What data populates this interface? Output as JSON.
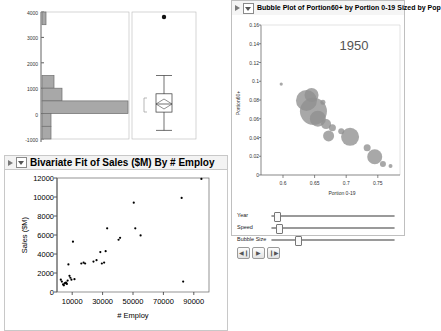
{
  "histogram_panel": {
    "name": "histogram-boxplot"
  },
  "bivariate_panel": {
    "title": "Bivariate Fit of Sales ($M) By # Employ",
    "disclosure_icon": "chevron-down-icon",
    "triangle_icon": "triangle-right-icon"
  },
  "bubble_panel": {
    "title": "Bubble Plot of Portion60+ by Portion 0-19 Sized by Pop",
    "disclosure_icon": "chevron-down-icon",
    "triangle_icon": "triangle-right-icon",
    "year_label": "1950",
    "controls": {
      "sliders": [
        {
          "label": "Year",
          "value_pct": 2
        },
        {
          "label": "Speed",
          "value_pct": 4
        },
        {
          "label": "Bubble Size",
          "value_pct": 19
        }
      ],
      "buttons": [
        {
          "name": "step-back-button",
          "glyph": "◀❙"
        },
        {
          "name": "play-button",
          "glyph": "▶"
        },
        {
          "name": "step-forward-button",
          "glyph": "❙▶"
        }
      ]
    }
  },
  "chart_data": [
    {
      "type": "bar",
      "id": "sales-histogram",
      "orientation": "horizontal",
      "title": "",
      "xlabel": "",
      "ylabel": "",
      "ylim": [
        -1000,
        4000
      ],
      "yticks": [
        -1000,
        0,
        1000,
        2000,
        3000,
        4000
      ],
      "grid": false,
      "bins": [
        {
          "low": 3500,
          "high": 4000,
          "count": 1
        },
        {
          "low": 1000,
          "high": 1500,
          "count": 3
        },
        {
          "low": 500,
          "high": 1000,
          "count": 5
        },
        {
          "low": 0,
          "high": 500,
          "count": 26
        },
        {
          "low": -500,
          "high": 0,
          "count": 2
        },
        {
          "low": -1000,
          "high": -500,
          "count": 2
        }
      ],
      "categories": [
        "-1000 to -500",
        "-500 to 0",
        "0 to 500",
        "500 to 1000",
        "1000 to 1500",
        "3500 to 4000"
      ],
      "values": [
        2,
        2,
        26,
        5,
        3,
        1
      ]
    },
    {
      "type": "boxplot",
      "id": "sales-boxplot",
      "title": "",
      "ylim": [
        -1000,
        4000
      ],
      "min_whisker": -700,
      "q1": 60,
      "median": 380,
      "q3": 780,
      "max_whisker": 1520,
      "outliers": [
        3800
      ],
      "mean_diamond": {
        "low": 180,
        "mid": 380,
        "high": 560
      }
    },
    {
      "type": "scatter",
      "id": "bivariate-fit",
      "title": "Bivariate Fit of Sales ($M) By # Employ",
      "xlabel": "# Employ",
      "ylabel": "Sales ($M)",
      "xlim": [
        0,
        100000
      ],
      "ylim": [
        0,
        12000
      ],
      "xticks": [
        10000,
        30000,
        50000,
        70000,
        90000
      ],
      "xticklabels": [
        "10000",
        "30000",
        "50000",
        "70000",
        "90000"
      ],
      "yticks": [
        0,
        2000,
        4000,
        6000,
        8000,
        10000,
        12000
      ],
      "yticklabels": [
        "0",
        "2000",
        "4000",
        "6000",
        "8000",
        "10000",
        "12000"
      ],
      "grid": false,
      "points": [
        [
          2500,
          1300
        ],
        [
          3200,
          1100
        ],
        [
          4000,
          800
        ],
        [
          4500,
          700
        ],
        [
          5000,
          900
        ],
        [
          5500,
          950
        ],
        [
          6000,
          1000
        ],
        [
          6500,
          850
        ],
        [
          7000,
          1200
        ],
        [
          7500,
          2900
        ],
        [
          8200,
          1700
        ],
        [
          8800,
          1500
        ],
        [
          9500,
          1300
        ],
        [
          10500,
          5300
        ],
        [
          11500,
          1350
        ],
        [
          16000,
          3000
        ],
        [
          17500,
          3100
        ],
        [
          18500,
          3000
        ],
        [
          24000,
          3200
        ],
        [
          26000,
          3350
        ],
        [
          28500,
          4200
        ],
        [
          29500,
          3000
        ],
        [
          31000,
          3100
        ],
        [
          32000,
          4300
        ],
        [
          33000,
          6700
        ],
        [
          40500,
          5500
        ],
        [
          41500,
          5700
        ],
        [
          50500,
          9400
        ],
        [
          51500,
          6700
        ],
        [
          55000,
          5950
        ],
        [
          82000,
          9900
        ],
        [
          83000,
          1100
        ],
        [
          95000,
          11900
        ]
      ]
    },
    {
      "type": "scatter",
      "id": "bubble-plot",
      "title": "Bubble Plot of Portion60+ by Portion 0-19 Sized by Pop",
      "xlabel": "Portion 0-19",
      "ylabel": "Portion60+",
      "xlim": [
        0.565,
        0.785
      ],
      "ylim": [
        0,
        0.165
      ],
      "xticks": [
        0.6,
        0.65,
        0.7,
        0.75
      ],
      "xticklabels": [
        "0.6",
        "0.65",
        "0.7",
        "0.75"
      ],
      "yticks": [
        0,
        0.02,
        0.04,
        0.06,
        0.08,
        0.1,
        0.12,
        0.14,
        0.16
      ],
      "yticklabels": [
        "0",
        "0.02",
        "0.04",
        "0.06",
        "0.08",
        "0.1",
        "0.12",
        "0.14",
        "0.16"
      ],
      "grid": false,
      "annotation": "1950",
      "bubbles": [
        {
          "x": 0.597,
          "y": 0.1,
          "size": 1.6
        },
        {
          "x": 0.637,
          "y": 0.082,
          "size": 10.5
        },
        {
          "x": 0.645,
          "y": 0.088,
          "size": 7.0
        },
        {
          "x": 0.648,
          "y": 0.07,
          "size": 13.5
        },
        {
          "x": 0.655,
          "y": 0.062,
          "size": 8.0
        },
        {
          "x": 0.663,
          "y": 0.08,
          "size": 2.5
        },
        {
          "x": 0.668,
          "y": 0.056,
          "size": 5.0
        },
        {
          "x": 0.672,
          "y": 0.043,
          "size": 5.5
        },
        {
          "x": 0.678,
          "y": 0.052,
          "size": 3.5
        },
        {
          "x": 0.692,
          "y": 0.048,
          "size": 3.0
        },
        {
          "x": 0.706,
          "y": 0.042,
          "size": 9.0
        },
        {
          "x": 0.733,
          "y": 0.03,
          "size": 3.5
        },
        {
          "x": 0.745,
          "y": 0.02,
          "size": 7.5
        },
        {
          "x": 0.758,
          "y": 0.012,
          "size": 3.0
        },
        {
          "x": 0.77,
          "y": 0.01,
          "size": 2.0
        }
      ]
    }
  ]
}
